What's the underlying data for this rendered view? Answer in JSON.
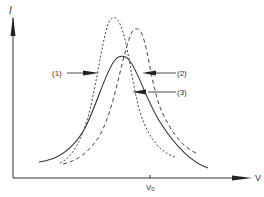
{
  "diagram": {
    "type": "resonance-curves",
    "y_axis": {
      "label": "I"
    },
    "x_axis": {
      "label": "V",
      "tick_label": "V₀",
      "tick_label_main": "V",
      "tick_label_sub": "0"
    },
    "curves": [
      {
        "id": "1",
        "label": "(1)",
        "style": "short-dashed",
        "peak_position": "left of V0",
        "relative_peak": "highest"
      },
      {
        "id": "2",
        "label": "(2)",
        "style": "long-dashed",
        "peak_position": "right of V0",
        "relative_peak": "middle"
      },
      {
        "id": "3",
        "label": "(3)",
        "style": "solid",
        "peak_position": "near V0",
        "relative_peak": "lowest"
      }
    ],
    "colors": {
      "line": "#333333",
      "background": "#ffffff"
    }
  }
}
